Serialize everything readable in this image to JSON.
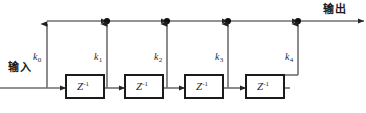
{
  "figure": {
    "type": "signal-flow-diagram",
    "input_label": "输入",
    "output_label": "输出",
    "delay_symbol": "Z",
    "delay_exponent": "-1",
    "coefficient_letter": "k",
    "colors": {
      "line": "#6f6f6f",
      "line_dark": "#4a4a4a",
      "node": "#111111",
      "block_border": "#1b1b1b",
      "text": "#1b1b1b",
      "background": "#ffffff"
    },
    "taps": [
      {
        "id": "k0",
        "label": "k",
        "subscript": "0"
      },
      {
        "id": "k1",
        "label": "k",
        "subscript": "1"
      },
      {
        "id": "k2",
        "label": "k",
        "subscript": "2"
      },
      {
        "id": "k3",
        "label": "k",
        "subscript": "3"
      },
      {
        "id": "k4",
        "label": "k",
        "subscript": "4"
      }
    ],
    "delay_blocks": [
      {
        "id": "delay-1",
        "symbol": "Z",
        "exponent": "-1"
      },
      {
        "id": "delay-2",
        "symbol": "Z",
        "exponent": "-1"
      },
      {
        "id": "delay-3",
        "symbol": "Z",
        "exponent": "-1"
      },
      {
        "id": "delay-4",
        "symbol": "Z",
        "exponent": "-1"
      }
    ],
    "summing_nodes": 4
  }
}
